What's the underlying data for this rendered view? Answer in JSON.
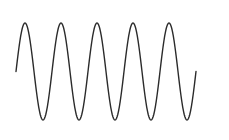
{
  "chart_data": {
    "type": "line",
    "title": "",
    "xlabel": "",
    "ylabel": "",
    "grid": false,
    "legend": null,
    "series": [
      {
        "name": "sine",
        "function": "sin",
        "periods": 5,
        "amplitude": 1,
        "phase": 0,
        "color": "#2b2b2b"
      }
    ],
    "xlim": [
      0,
      31.4159
    ],
    "ylim": [
      -1,
      1
    ]
  },
  "style": {
    "stroke_color": "#2b2b2b",
    "stroke_width": 1.4,
    "background": "#ffffff"
  },
  "layout": {
    "x_start_px": 16,
    "x_end_px": 196,
    "center_y_px": 71.5,
    "amplitude_px": 48.5
  }
}
